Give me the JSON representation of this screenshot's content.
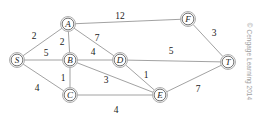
{
  "figure": {
    "credit": "© Cengage Learning 2014",
    "background_color": "#ffffff",
    "edge_color": "#8a8a8a",
    "node_stroke_color": "#5a5a5a",
    "label_color": "#1a1a1a"
  },
  "chart_data": {
    "type": "diagram",
    "diagram_kind": "weighted-undirected-graph",
    "nodes": [
      {
        "id": "S",
        "label": "S",
        "x": 17,
        "y": 60
      },
      {
        "id": "A",
        "label": "A",
        "x": 68,
        "y": 24
      },
      {
        "id": "B",
        "label": "B",
        "x": 70,
        "y": 60
      },
      {
        "id": "C",
        "label": "C",
        "x": 70,
        "y": 95
      },
      {
        "id": "D",
        "label": "D",
        "x": 120,
        "y": 60
      },
      {
        "id": "E",
        "label": "E",
        "x": 160,
        "y": 95
      },
      {
        "id": "F",
        "label": "F",
        "x": 188,
        "y": 19
      },
      {
        "id": "T",
        "label": "T",
        "x": 228,
        "y": 62
      }
    ],
    "edges": [
      {
        "from": "S",
        "to": "A",
        "weight": 2,
        "label_x": 34,
        "label_y": 36
      },
      {
        "from": "S",
        "to": "B",
        "weight": 5,
        "label_x": 46,
        "label_y": 53
      },
      {
        "from": "S",
        "to": "C",
        "weight": 4,
        "label_x": 37,
        "label_y": 88
      },
      {
        "from": "A",
        "to": "B",
        "weight": 2,
        "label_x": 62,
        "label_y": 42
      },
      {
        "from": "A",
        "to": "D",
        "weight": 7,
        "label_x": 97,
        "label_y": 38
      },
      {
        "from": "A",
        "to": "F",
        "weight": 12,
        "label_x": 120,
        "label_y": 16
      },
      {
        "from": "B",
        "to": "D",
        "weight": 4,
        "label_x": 93,
        "label_y": 52
      },
      {
        "from": "B",
        "to": "C",
        "weight": 1,
        "label_x": 63,
        "label_y": 78
      },
      {
        "from": "B",
        "to": "E",
        "weight": 3,
        "label_x": 106,
        "label_y": 80
      },
      {
        "from": "C",
        "to": "E",
        "weight": 4,
        "label_x": 116,
        "label_y": 110
      },
      {
        "from": "D",
        "to": "E",
        "weight": 1,
        "label_x": 146,
        "label_y": 75
      },
      {
        "from": "D",
        "to": "T",
        "weight": 5,
        "label_x": 171,
        "label_y": 51
      },
      {
        "from": "E",
        "to": "T",
        "weight": 7,
        "label_x": 198,
        "label_y": 89
      },
      {
        "from": "F",
        "to": "T",
        "weight": 3,
        "label_x": 214,
        "label_y": 33
      }
    ],
    "node_radius": 7.5
  }
}
